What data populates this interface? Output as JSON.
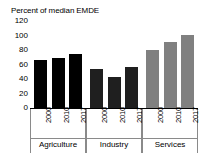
{
  "chart_data": {
    "type": "bar",
    "title": "Percent of median EMDE",
    "xlabel": "",
    "ylabel": "",
    "ylim": [
      0,
      120
    ],
    "ytick_labels": [
      "120",
      "100",
      "80",
      "60",
      "40",
      "20",
      "0"
    ],
    "yticks": [
      120,
      100,
      80,
      60,
      40,
      20,
      0
    ],
    "grid": false,
    "legend": "none",
    "categories": [
      "Agriculture",
      "Industry",
      "Services"
    ],
    "x": [
      "2000",
      "2010",
      "2017"
    ],
    "series": [
      {
        "name": "Agriculture",
        "values": [
          67,
          70,
          76
        ],
        "color": "#000000"
      },
      {
        "name": "Industry",
        "values": [
          55,
          44,
          58
        ],
        "color": "#1f1f1f"
      },
      {
        "name": "Services",
        "values": [
          81,
          92,
          102
        ],
        "color": "#808080"
      }
    ],
    "groups": [
      {
        "label": "Agriculture",
        "color": "#000000",
        "bars": [
          {
            "year": "2000",
            "value": 67
          },
          {
            "year": "2010",
            "value": 70
          },
          {
            "year": "2017",
            "value": 76
          }
        ]
      },
      {
        "label": "Industry",
        "color": "#1f1f1f",
        "bars": [
          {
            "year": "2000",
            "value": 55
          },
          {
            "year": "2010",
            "value": 44
          },
          {
            "year": "2017",
            "value": 58
          }
        ]
      },
      {
        "label": "Services",
        "color": "#808080",
        "bars": [
          {
            "year": "2000",
            "value": 81
          },
          {
            "year": "2010",
            "value": 92
          },
          {
            "year": "2017",
            "value": 102
          }
        ]
      }
    ]
  }
}
